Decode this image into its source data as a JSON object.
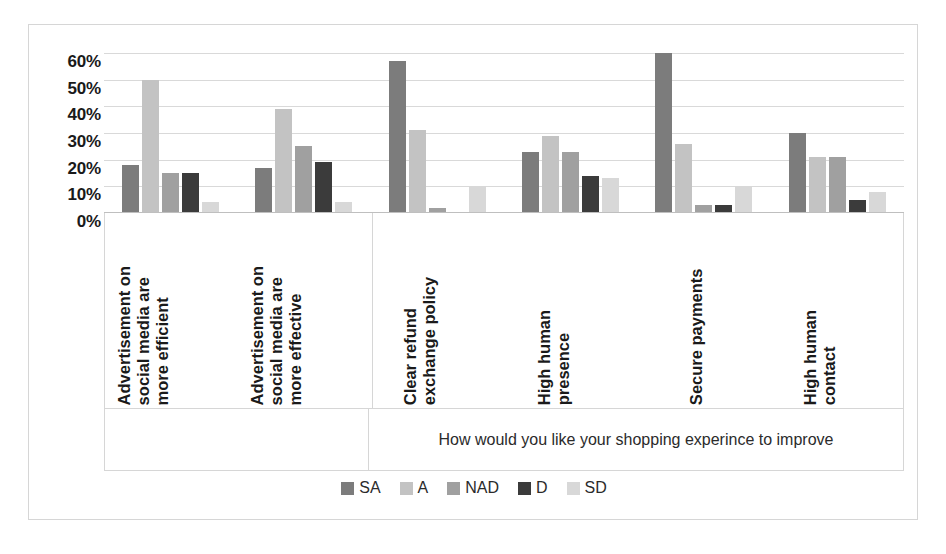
{
  "chart_data": {
    "type": "bar",
    "title": "",
    "xlabel": "How would you like your shopping experince to improve",
    "ylabel": "",
    "ylim": [
      0,
      60
    ],
    "grid": true,
    "legend_position": "bottom",
    "ytick_labels": [
      "60%",
      "50%",
      "40%",
      "30%",
      "20%",
      "10%",
      "0%"
    ],
    "ytick_values": [
      60,
      50,
      40,
      30,
      20,
      10,
      0
    ],
    "categories": [
      "Advertisement on social media are more efficient",
      "Advertisement on social media are more effective",
      "Clear refund exchange policy",
      "High human presence",
      "Secure payments",
      "High human contact"
    ],
    "category_lines": [
      "Advertisement on\nsocial media are\nmore efficient",
      "Advertisement on\nsocial media are\nmore effective",
      "Clear refund\nexchange policy",
      "High human\npresence",
      "Secure payments",
      "High human\ncontact"
    ],
    "series": [
      {
        "name": "SA",
        "color": "#7c7c7c",
        "values": [
          18,
          17,
          57,
          23,
          60,
          30
        ]
      },
      {
        "name": "A",
        "color": "#c3c3c3",
        "values": [
          50,
          39,
          31,
          29,
          26,
          21
        ]
      },
      {
        "name": "NAD",
        "color": "#a0a0a0",
        "values": [
          15,
          25,
          2,
          23,
          3,
          21
        ]
      },
      {
        "name": "D",
        "color": "#3b3b3b",
        "values": [
          15,
          19,
          0,
          14,
          3,
          5
        ]
      },
      {
        "name": "SD",
        "color": "#d8d8d8",
        "values": [
          4,
          4,
          10,
          13,
          10,
          8
        ]
      }
    ]
  },
  "legend": {
    "items": [
      {
        "label": "SA",
        "color": "#7c7c7c"
      },
      {
        "label": "A",
        "color": "#c3c3c3"
      },
      {
        "label": "NAD",
        "color": "#a0a0a0"
      },
      {
        "label": "D",
        "color": "#3b3b3b"
      },
      {
        "label": "SD",
        "color": "#d8d8d8"
      }
    ]
  },
  "axis_title": "How would you like your shopping experince to improve"
}
